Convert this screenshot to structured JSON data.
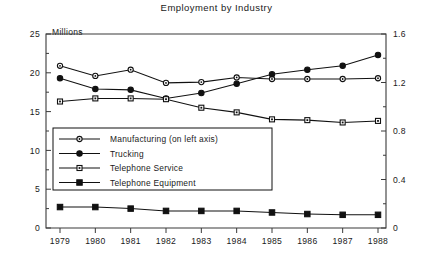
{
  "chart_data": {
    "type": "line",
    "title": "Employment by Industry",
    "unit_label": "Millions",
    "xlabel": "",
    "ylabel": "",
    "grid": false,
    "legend_position": "inside-lower-left",
    "x": [
      "1979",
      "1980",
      "1981",
      "1982",
      "1983",
      "1984",
      "1985",
      "1986",
      "1987",
      "1988"
    ],
    "categories": [
      "1979",
      "1980",
      "1981",
      "1982",
      "1983",
      "1984",
      "1985",
      "1986",
      "1987",
      "1988"
    ],
    "left_axis": {
      "ticks": [
        "0",
        "5",
        "10",
        "15",
        "20",
        "25"
      ],
      "tick_values": [
        0,
        5,
        10,
        15,
        20,
        25
      ],
      "ylim": [
        0,
        25
      ],
      "label": "Millions"
    },
    "right_axis": {
      "ticks": [
        "0",
        "0.4",
        "0.8",
        "1.2",
        "1.6"
      ],
      "tick_values": [
        0,
        0.4,
        0.8,
        1.2,
        1.6
      ],
      "ylim": [
        0,
        1.6
      ],
      "label": ""
    },
    "series": [
      {
        "name": "Manufacturing (on left axis)",
        "axis": "left",
        "marker": "open-circle",
        "values": [
          20.9,
          19.6,
          20.4,
          18.7,
          18.8,
          19.4,
          19.2,
          19.2,
          19.2,
          19.3
        ]
      },
      {
        "name": "Trucking",
        "axis": "right",
        "marker": "filled-circle",
        "values": [
          19.3,
          17.9,
          17.8,
          16.7,
          17.4,
          18.6,
          19.8,
          20.4,
          20.9,
          22.3
        ]
      },
      {
        "name": "Telephone Service",
        "axis": "right",
        "marker": "open-square",
        "values": [
          16.3,
          16.7,
          16.7,
          16.6,
          15.5,
          14.9,
          14.0,
          13.9,
          13.6,
          13.8
        ]
      },
      {
        "name": "Telephone Equipment",
        "axis": "right",
        "marker": "filled-square",
        "values": [
          2.7,
          2.7,
          2.5,
          2.2,
          2.2,
          2.2,
          2.0,
          1.8,
          1.7,
          1.7
        ]
      }
    ]
  }
}
